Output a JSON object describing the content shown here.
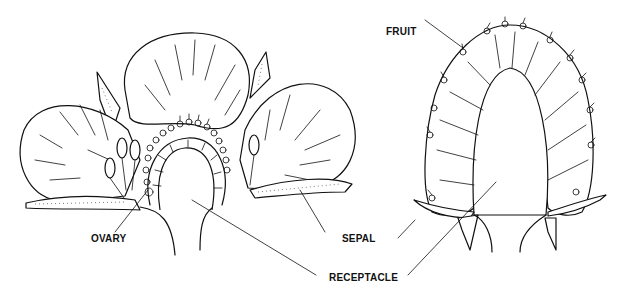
{
  "diagram": {
    "labels": {
      "fruit": "FRUIT",
      "ovary": "OVARY",
      "sepal": "SEPAL",
      "receptacle": "RECEPTACLE"
    },
    "panels": [
      {
        "name": "flower-section",
        "parts": [
          "petal",
          "petal",
          "petal",
          "sepal",
          "stamen",
          "ovary",
          "receptacle"
        ]
      },
      {
        "name": "fruit-section",
        "parts": [
          "fruit",
          "achene",
          "sepal",
          "receptacle"
        ]
      }
    ],
    "colors": {
      "ink": "#111111",
      "background": "#ffffff"
    }
  }
}
